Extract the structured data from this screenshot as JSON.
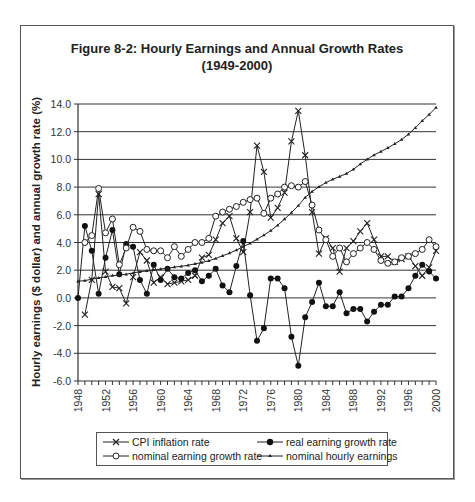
{
  "chart_data": {
    "type": "line",
    "title": "Figure 8-2:  Hourly Earnings and Annual Growth Rates",
    "subtitle": "(1949-2000)",
    "xlabel": "",
    "ylabel": "Hourly earnings ($ dollar) and annual growth rate (%)",
    "xlim": [
      1948,
      2000
    ],
    "ylim": [
      -6.0,
      14.0
    ],
    "grid": true,
    "legend_position": "bottom",
    "x_tick_labels": [
      "1948",
      "1952",
      "1956",
      "1960",
      "1964",
      "1968",
      "1972",
      "1976",
      "1980",
      "1984",
      "1988",
      "1992",
      "1996",
      "2000"
    ],
    "y_tick_labels": [
      "14.0",
      "12.0",
      "10.0",
      "8.0",
      "6.0",
      "4.0",
      "2.0",
      "0.0",
      "-2.0",
      "-4.0",
      "-6.0"
    ],
    "x": [
      1948,
      1949,
      1950,
      1951,
      1952,
      1953,
      1954,
      1955,
      1956,
      1957,
      1958,
      1959,
      1960,
      1961,
      1962,
      1963,
      1964,
      1965,
      1966,
      1967,
      1968,
      1969,
      1970,
      1971,
      1972,
      1973,
      1974,
      1975,
      1976,
      1977,
      1978,
      1979,
      1980,
      1981,
      1982,
      1983,
      1984,
      1985,
      1986,
      1987,
      1988,
      1989,
      1990,
      1991,
      1992,
      1993,
      1994,
      1995,
      1996,
      1997,
      1998,
      1999,
      2000
    ],
    "series": [
      {
        "name": "CPI inflation rate",
        "marker": "x",
        "values": [
          null,
          -1.2,
          1.3,
          7.5,
          1.9,
          0.8,
          0.7,
          -0.4,
          1.5,
          3.3,
          2.7,
          1.1,
          1.5,
          1.0,
          1.1,
          1.2,
          1.3,
          1.6,
          2.9,
          3.1,
          4.2,
          5.4,
          5.9,
          4.3,
          3.3,
          6.2,
          11.0,
          9.1,
          5.8,
          6.5,
          7.6,
          11.3,
          13.5,
          10.3,
          6.2,
          3.2,
          4.3,
          3.6,
          1.9,
          3.6,
          4.1,
          4.8,
          5.4,
          4.2,
          3.0,
          3.0,
          2.6,
          2.8,
          3.0,
          2.3,
          1.6,
          2.2,
          3.4
        ]
      },
      {
        "name": "real earning growth rate",
        "marker": "filled-circle",
        "values": [
          0.0,
          5.2,
          3.4,
          0.3,
          2.9,
          4.9,
          1.7,
          3.9,
          3.7,
          1.3,
          0.3,
          2.4,
          1.3,
          2.1,
          1.5,
          1.4,
          1.8,
          2.0,
          1.2,
          1.6,
          2.1,
          0.9,
          0.4,
          2.3,
          4.1,
          0.2,
          -3.1,
          -2.2,
          1.4,
          1.4,
          0.7,
          -2.8,
          -4.9,
          -1.4,
          -0.3,
          1.1,
          -0.6,
          -0.6,
          0.4,
          -1.1,
          -0.8,
          -0.8,
          -1.7,
          -1.0,
          -0.5,
          -0.5,
          0.1,
          0.1,
          0.7,
          1.6,
          2.4,
          1.9,
          1.4
        ]
      },
      {
        "name": "nominal earning growth rate",
        "marker": "open-circle",
        "values": [
          null,
          4.0,
          4.5,
          7.9,
          4.7,
          5.7,
          2.4,
          3.6,
          5.1,
          4.8,
          3.5,
          3.4,
          3.4,
          2.9,
          3.7,
          3.0,
          3.5,
          4.0,
          4.0,
          4.3,
          5.9,
          6.2,
          6.4,
          6.6,
          6.9,
          7.1,
          7.2,
          6.1,
          7.2,
          7.5,
          8.0,
          8.1,
          8.0,
          8.4,
          6.7,
          4.9,
          4.2,
          3.0,
          3.6,
          2.6,
          3.2,
          3.6,
          4.0,
          3.5,
          2.7,
          2.5,
          2.6,
          2.9,
          3.0,
          3.2,
          3.5,
          4.2,
          3.7
        ]
      },
      {
        "name": "nominal hourly earnings",
        "marker": "small-triangle",
        "values": [
          1.2,
          1.25,
          1.35,
          1.45,
          1.52,
          1.61,
          1.65,
          1.71,
          1.8,
          1.89,
          1.95,
          2.02,
          2.09,
          2.14,
          2.22,
          2.28,
          2.36,
          2.46,
          2.56,
          2.68,
          2.85,
          3.04,
          3.23,
          3.45,
          3.7,
          3.94,
          4.24,
          4.53,
          4.86,
          5.25,
          5.69,
          6.16,
          6.66,
          7.25,
          7.68,
          8.02,
          8.32,
          8.57,
          8.76,
          8.98,
          9.28,
          9.66,
          10.01,
          10.32,
          10.57,
          10.83,
          11.12,
          11.43,
          11.82,
          12.28,
          12.78,
          13.24,
          13.75
        ]
      }
    ]
  },
  "legend": {
    "items": [
      {
        "label": "CPI inflation rate"
      },
      {
        "label": "real earning growth rate"
      },
      {
        "label": "nominal earning growth rate"
      },
      {
        "label": "nominal hourly earnings"
      }
    ]
  },
  "colors": {
    "line": "#222222",
    "grid": "#333333",
    "frame": "#555555"
  }
}
